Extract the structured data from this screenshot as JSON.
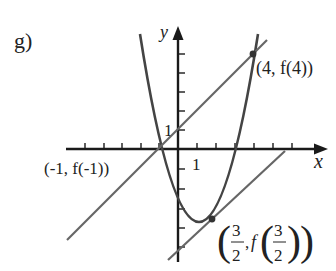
{
  "figure": {
    "part_label": "g)",
    "axes": {
      "x_label": "x",
      "y_label": "y",
      "x_unit_label": "1",
      "y_unit_label": "1",
      "origin_px": [
        178,
        149
      ],
      "unit_px": 19
    },
    "curve": {
      "name": "f(x)",
      "type": "parabola",
      "color": "#444444"
    },
    "lines": [
      {
        "name": "secant-line",
        "through": [
          "(-1, f(-1))",
          "(4, f(4))"
        ],
        "color": "#666666"
      },
      {
        "name": "tangent-line",
        "through": [
          "(3/2, f(3/2))"
        ],
        "color": "#666666"
      }
    ],
    "point_labels": {
      "p_minus1": "(-1, f(-1))",
      "p_4": "(4, f(4))",
      "p_3_2_num": "3",
      "p_3_2_den": "2",
      "p_3_2_f": "f"
    },
    "colors": {
      "axis": "#1a1a1a",
      "curve": "#444444",
      "line": "#666666",
      "text": "#222222"
    }
  }
}
